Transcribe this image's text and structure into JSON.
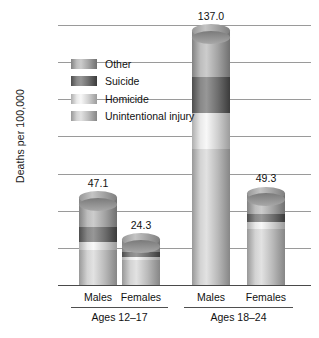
{
  "chart_data": {
    "type": "bar",
    "subtype": "stacked-bar",
    "title": "",
    "xlabel": "",
    "ylabel": "Deaths per 100,000",
    "ylim": [
      0,
      140
    ],
    "yticks": [
      0,
      20,
      40,
      60,
      80,
      100,
      120,
      140
    ],
    "grid": true,
    "legend_position": "inside-upper-left",
    "categories": [
      "Males",
      "Females",
      "Males",
      "Females"
    ],
    "groups": [
      {
        "label": "Ages 12–17",
        "categories": [
          "Males",
          "Females"
        ]
      },
      {
        "label": "Ages 18–24",
        "categories": [
          "Males",
          "Females"
        ]
      }
    ],
    "series": [
      {
        "name": "Unintentional injury",
        "color": "#b9b9b9",
        "values": [
          18.9,
          13.3,
          73.3,
          30.4
        ]
      },
      {
        "name": "Homicide",
        "color": "#cfcfcf",
        "values": [
          4.5,
          2.0,
          19.4,
          3.6
        ]
      },
      {
        "name": "Suicide",
        "color": "#6e6e6e",
        "values": [
          7.6,
          2.6,
          19.1,
          4.0
        ]
      },
      {
        "name": "Other",
        "color": "#a3a3a3",
        "values": [
          16.1,
          6.4,
          25.2,
          11.3
        ]
      }
    ],
    "totals": [
      47.1,
      24.3,
      137.0,
      49.3
    ],
    "total_labels": [
      "47.1",
      "24.3",
      "137.0",
      "49.3"
    ]
  },
  "axis": {
    "y_title": "Deaths per 100,000",
    "tick_labels": [
      "140",
      "120",
      "100",
      "80",
      "60",
      "40",
      "20",
      "0"
    ]
  },
  "legend": {
    "items": [
      {
        "label": "Other",
        "swatch": "legend-swatch-other"
      },
      {
        "label": "Suicide",
        "swatch": "legend-swatch-suicide"
      },
      {
        "label": "Homicide",
        "swatch": "legend-swatch-homicide"
      },
      {
        "label": "Unintentional injury",
        "swatch": "legend-swatch-unintentional-injury"
      }
    ]
  },
  "bars": [
    {
      "category": "Males",
      "value_label": "47.1"
    },
    {
      "category": "Females",
      "value_label": "24.3"
    },
    {
      "category": "Males",
      "value_label": "137.0"
    },
    {
      "category": "Females",
      "value_label": "49.3"
    }
  ],
  "groups": [
    {
      "label": "Ages 12–17"
    },
    {
      "label": "Ages 18–24"
    }
  ],
  "colors": {
    "other": "#a3a3a3",
    "suicide": "#6e6e6e",
    "homicide": "#cfcfcf",
    "unintentional_injury": "#b9b9b9",
    "gridline": "#9a9a9a",
    "axis": "#4a4a4a",
    "text": "#111111"
  }
}
